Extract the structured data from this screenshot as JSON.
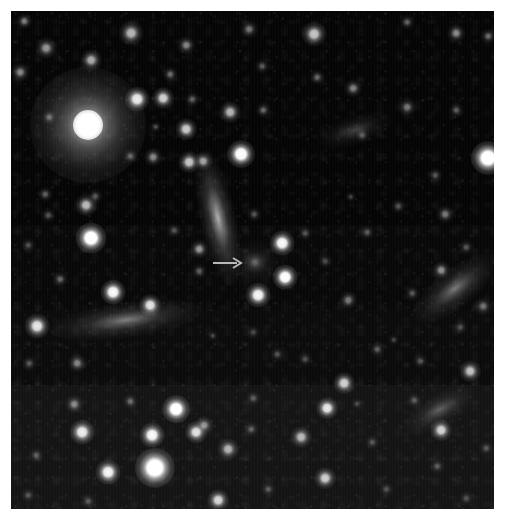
{
  "figure": {
    "domain": "astronomical-image",
    "kind": "optical sky field / deep image cutout",
    "width_px": 509,
    "height_px": 529,
    "margin_color": "#ffffff",
    "sky_color": "#000000",
    "frame": {
      "left": 11,
      "top": 11,
      "width": 483,
      "height": 498
    },
    "caption_text": "",
    "labels": []
  },
  "annotation": {
    "marker_type": "arrow",
    "direction": "right",
    "color": "#b9b9b9",
    "tail_x": 213,
    "tail_y": 263,
    "tip_x": 241,
    "tip_y": 263,
    "length_px": 28,
    "thickness_px": 2,
    "points_to": "faint-diffuse-source",
    "target_x": 255,
    "target_y": 262
  },
  "background_bands": [
    {
      "top": 0,
      "height": 214,
      "color": "#050505"
    },
    {
      "top": 214,
      "height": 85,
      "color": "#080808"
    },
    {
      "top": 299,
      "height": 75,
      "color": "#0b0b0b"
    },
    {
      "top": 374,
      "height": 124,
      "color": "#141414"
    }
  ],
  "bright_star": {
    "name": "saturated-foreground-star",
    "x": 88,
    "y": 125,
    "core_radius": 15,
    "halo_radius": 58,
    "peak_color": "#ffffff"
  },
  "point_sources": [
    {
      "x": 24,
      "y": 21,
      "r": 5,
      "b": 0.42
    },
    {
      "x": 46,
      "y": 48,
      "r": 7,
      "b": 0.5
    },
    {
      "x": 20,
      "y": 72,
      "r": 6,
      "b": 0.46
    },
    {
      "x": 131,
      "y": 33,
      "r": 8,
      "b": 0.62
    },
    {
      "x": 91,
      "y": 60,
      "r": 7,
      "b": 0.58
    },
    {
      "x": 186,
      "y": 45,
      "r": 6,
      "b": 0.44
    },
    {
      "x": 170,
      "y": 74,
      "r": 5,
      "b": 0.36
    },
    {
      "x": 137,
      "y": 99,
      "r": 8,
      "b": 0.82
    },
    {
      "x": 163,
      "y": 98,
      "r": 7,
      "b": 0.72
    },
    {
      "x": 192,
      "y": 99,
      "r": 5,
      "b": 0.32
    },
    {
      "x": 186,
      "y": 129,
      "r": 7,
      "b": 0.7
    },
    {
      "x": 156,
      "y": 127,
      "r": 4,
      "b": 0.26
    },
    {
      "x": 130,
      "y": 156,
      "r": 5,
      "b": 0.3
    },
    {
      "x": 153,
      "y": 157,
      "r": 6,
      "b": 0.44
    },
    {
      "x": 189,
      "y": 162,
      "r": 7,
      "b": 0.68
    },
    {
      "x": 203,
      "y": 161,
      "r": 6,
      "b": 0.55
    },
    {
      "x": 241,
      "y": 154,
      "r": 9,
      "b": 0.92
    },
    {
      "x": 249,
      "y": 29,
      "r": 6,
      "b": 0.38
    },
    {
      "x": 262,
      "y": 66,
      "r": 5,
      "b": 0.3
    },
    {
      "x": 230,
      "y": 112,
      "r": 7,
      "b": 0.62
    },
    {
      "x": 263,
      "y": 110,
      "r": 5,
      "b": 0.34
    },
    {
      "x": 314,
      "y": 34,
      "r": 8,
      "b": 0.68
    },
    {
      "x": 353,
      "y": 88,
      "r": 6,
      "b": 0.42
    },
    {
      "x": 317,
      "y": 77,
      "r": 5,
      "b": 0.34
    },
    {
      "x": 456,
      "y": 33,
      "r": 6,
      "b": 0.46
    },
    {
      "x": 488,
      "y": 36,
      "r": 5,
      "b": 0.36
    },
    {
      "x": 407,
      "y": 22,
      "r": 5,
      "b": 0.3
    },
    {
      "x": 407,
      "y": 107,
      "r": 6,
      "b": 0.4
    },
    {
      "x": 488,
      "y": 158,
      "r": 11,
      "b": 0.98
    },
    {
      "x": 456,
      "y": 110,
      "r": 5,
      "b": 0.3
    },
    {
      "x": 362,
      "y": 135,
      "r": 5,
      "b": 0.26
    },
    {
      "x": 435,
      "y": 175,
      "r": 5,
      "b": 0.28
    },
    {
      "x": 49,
      "y": 117,
      "r": 5,
      "b": 0.34
    },
    {
      "x": 45,
      "y": 194,
      "r": 5,
      "b": 0.32
    },
    {
      "x": 48,
      "y": 215,
      "r": 5,
      "b": 0.28
    },
    {
      "x": 86,
      "y": 205,
      "r": 7,
      "b": 0.64
    },
    {
      "x": 91,
      "y": 238,
      "r": 10,
      "b": 0.95
    },
    {
      "x": 95,
      "y": 196,
      "r": 5,
      "b": 0.3
    },
    {
      "x": 28,
      "y": 245,
      "r": 5,
      "b": 0.26
    },
    {
      "x": 60,
      "y": 279,
      "r": 5,
      "b": 0.34
    },
    {
      "x": 113,
      "y": 292,
      "r": 8,
      "b": 0.88
    },
    {
      "x": 37,
      "y": 326,
      "r": 8,
      "b": 0.8
    },
    {
      "x": 29,
      "y": 363,
      "r": 5,
      "b": 0.28
    },
    {
      "x": 77,
      "y": 363,
      "r": 6,
      "b": 0.44
    },
    {
      "x": 150,
      "y": 305,
      "r": 7,
      "b": 0.78
    },
    {
      "x": 174,
      "y": 230,
      "r": 5,
      "b": 0.26
    },
    {
      "x": 199,
      "y": 249,
      "r": 6,
      "b": 0.5
    },
    {
      "x": 199,
      "y": 271,
      "r": 5,
      "b": 0.3
    },
    {
      "x": 282,
      "y": 243,
      "r": 8,
      "b": 0.88
    },
    {
      "x": 285,
      "y": 277,
      "r": 8,
      "b": 0.92
    },
    {
      "x": 258,
      "y": 295,
      "r": 8,
      "b": 0.86
    },
    {
      "x": 255,
      "y": 262,
      "r": 7,
      "b": 0.2
    },
    {
      "x": 254,
      "y": 214,
      "r": 5,
      "b": 0.28
    },
    {
      "x": 305,
      "y": 233,
      "r": 5,
      "b": 0.26
    },
    {
      "x": 325,
      "y": 261,
      "r": 5,
      "b": 0.24
    },
    {
      "x": 367,
      "y": 232,
      "r": 5,
      "b": 0.3
    },
    {
      "x": 348,
      "y": 300,
      "r": 6,
      "b": 0.4
    },
    {
      "x": 412,
      "y": 293,
      "r": 5,
      "b": 0.28
    },
    {
      "x": 441,
      "y": 270,
      "r": 6,
      "b": 0.48
    },
    {
      "x": 466,
      "y": 247,
      "r": 5,
      "b": 0.28
    },
    {
      "x": 460,
      "y": 327,
      "r": 5,
      "b": 0.26
    },
    {
      "x": 483,
      "y": 306,
      "r": 6,
      "b": 0.38
    },
    {
      "x": 253,
      "y": 332,
      "r": 5,
      "b": 0.22
    },
    {
      "x": 213,
      "y": 336,
      "r": 4,
      "b": 0.22
    },
    {
      "x": 277,
      "y": 354,
      "r": 5,
      "b": 0.26
    },
    {
      "x": 305,
      "y": 359,
      "r": 5,
      "b": 0.24
    },
    {
      "x": 377,
      "y": 349,
      "r": 5,
      "b": 0.3
    },
    {
      "x": 394,
      "y": 340,
      "r": 4,
      "b": 0.22
    },
    {
      "x": 470,
      "y": 371,
      "r": 7,
      "b": 0.66
    },
    {
      "x": 420,
      "y": 361,
      "r": 5,
      "b": 0.26
    },
    {
      "x": 344,
      "y": 383,
      "r": 7,
      "b": 0.72
    },
    {
      "x": 357,
      "y": 404,
      "r": 4,
      "b": 0.22
    },
    {
      "x": 414,
      "y": 400,
      "r": 5,
      "b": 0.28
    },
    {
      "x": 327,
      "y": 408,
      "r": 7,
      "b": 0.8
    },
    {
      "x": 253,
      "y": 398,
      "r": 5,
      "b": 0.28
    },
    {
      "x": 204,
      "y": 425,
      "r": 6,
      "b": 0.48
    },
    {
      "x": 228,
      "y": 449,
      "r": 7,
      "b": 0.6
    },
    {
      "x": 251,
      "y": 429,
      "r": 5,
      "b": 0.3
    },
    {
      "x": 301,
      "y": 437,
      "r": 7,
      "b": 0.62
    },
    {
      "x": 325,
      "y": 478,
      "r": 7,
      "b": 0.7
    },
    {
      "x": 268,
      "y": 489,
      "r": 5,
      "b": 0.28
    },
    {
      "x": 218,
      "y": 500,
      "r": 7,
      "b": 0.74
    },
    {
      "x": 176,
      "y": 409,
      "r": 9,
      "b": 0.95
    },
    {
      "x": 152,
      "y": 435,
      "r": 8,
      "b": 0.88
    },
    {
      "x": 196,
      "y": 432,
      "r": 7,
      "b": 0.78
    },
    {
      "x": 155,
      "y": 468,
      "r": 13,
      "b": 1.0
    },
    {
      "x": 108,
      "y": 472,
      "r": 8,
      "b": 0.86
    },
    {
      "x": 82,
      "y": 432,
      "r": 8,
      "b": 0.82
    },
    {
      "x": 74,
      "y": 404,
      "r": 6,
      "b": 0.44
    },
    {
      "x": 130,
      "y": 401,
      "r": 5,
      "b": 0.32
    },
    {
      "x": 36,
      "y": 455,
      "r": 5,
      "b": 0.28
    },
    {
      "x": 28,
      "y": 495,
      "r": 5,
      "b": 0.26
    },
    {
      "x": 88,
      "y": 501,
      "r": 5,
      "b": 0.28
    },
    {
      "x": 441,
      "y": 430,
      "r": 7,
      "b": 0.72
    },
    {
      "x": 437,
      "y": 466,
      "r": 5,
      "b": 0.28
    },
    {
      "x": 486,
      "y": 448,
      "r": 5,
      "b": 0.26
    },
    {
      "x": 466,
      "y": 498,
      "r": 5,
      "b": 0.24
    },
    {
      "x": 372,
      "y": 442,
      "r": 5,
      "b": 0.26
    },
    {
      "x": 386,
      "y": 489,
      "r": 5,
      "b": 0.24
    },
    {
      "x": 445,
      "y": 214,
      "r": 6,
      "b": 0.4
    },
    {
      "x": 398,
      "y": 206,
      "r": 5,
      "b": 0.26
    },
    {
      "x": 351,
      "y": 197,
      "r": 4,
      "b": 0.22
    }
  ],
  "extended_sources": [
    {
      "name": "edge-on-galaxy-center",
      "x": 218,
      "y": 218,
      "w": 12,
      "h": 46,
      "rot": -12,
      "b": 0.72
    },
    {
      "name": "edge-on-galaxy-left",
      "x": 126,
      "y": 320,
      "w": 52,
      "h": 12,
      "rot": -8,
      "b": 0.5
    },
    {
      "name": "edge-on-galaxy-right",
      "x": 455,
      "y": 288,
      "w": 34,
      "h": 13,
      "rot": -38,
      "b": 0.48
    },
    {
      "name": "faint-galaxy-lower",
      "x": 440,
      "y": 409,
      "w": 28,
      "h": 11,
      "rot": -30,
      "b": 0.34
    },
    {
      "name": "faint-galaxy-upper",
      "x": 355,
      "y": 130,
      "w": 26,
      "h": 10,
      "rot": -18,
      "b": 0.26
    },
    {
      "name": "arrow-target-diffuse",
      "x": 255,
      "y": 262,
      "w": 18,
      "h": 15,
      "rot": 0,
      "b": 0.22
    }
  ]
}
